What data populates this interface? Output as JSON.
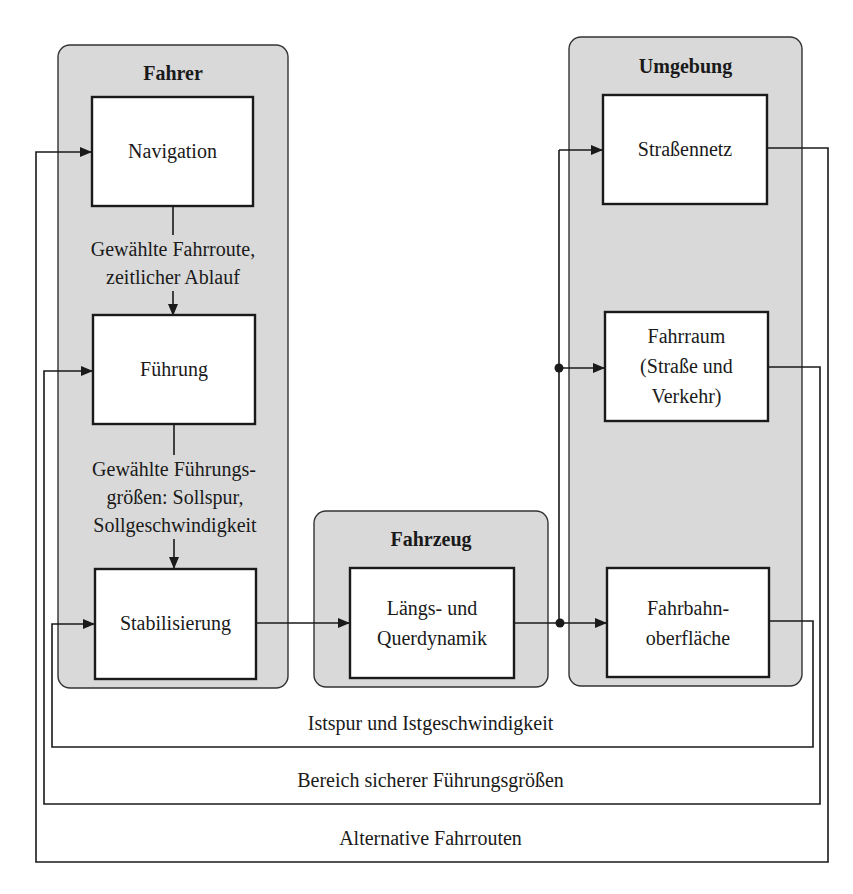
{
  "diagram": {
    "title": "",
    "colors": {
      "group_fill": "#d9d9d9",
      "box_fill": "#ffffff",
      "line": "#1a1a1a",
      "background": "#ffffff"
    },
    "groups": [
      {
        "id": "fahrer",
        "label": "Fahrer"
      },
      {
        "id": "fahrzeug",
        "label": "Fahrzeug"
      },
      {
        "id": "umgebung",
        "label": "Umgebung"
      }
    ],
    "nodes": {
      "navigation": {
        "label": "Navigation",
        "group": "fahrer"
      },
      "fuehrung": {
        "label": "Führung",
        "group": "fahrer"
      },
      "stabilisierung": {
        "label": "Stabilisierung",
        "group": "fahrer"
      },
      "dynamik": {
        "line1": "Längs- und",
        "line2": "Querdynamik",
        "group": "fahrzeug"
      },
      "strassennetz": {
        "label": "Straßennetz",
        "group": "umgebung"
      },
      "fahrraum": {
        "line1": "Fahrraum",
        "line2": "(Straße und",
        "line3": "Verkehr)",
        "group": "umgebung"
      },
      "fahrbahn": {
        "line1": "Fahrbahn-",
        "line2": "oberfläche",
        "group": "umgebung"
      }
    },
    "edges": {
      "nav_to_fuehrung": {
        "line1": "Gewählte Fahrroute,",
        "line2": "zeitlicher Ablauf"
      },
      "fuehrung_to_stab": {
        "line1": "Gewählte Führungs-",
        "line2": "größen: Sollspur,",
        "line3": "Sollgeschwindigkeit"
      },
      "stab_to_dynamik": {
        "label": ""
      },
      "dynamik_to_umgebung": {
        "label": ""
      }
    },
    "feedback_loops": [
      {
        "id": "istspur",
        "label": "Istspur und Istgeschwindigkeit",
        "from": "fahrbahn",
        "to": "stabilisierung"
      },
      {
        "id": "bereich",
        "label": "Bereich sicherer Führungsgrößen",
        "from": "fahrraum",
        "to": "fuehrung"
      },
      {
        "id": "alternative",
        "label": "Alternative Fahrrouten",
        "from": "strassennetz",
        "to": "navigation"
      }
    ]
  }
}
